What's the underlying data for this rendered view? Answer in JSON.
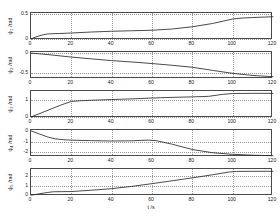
{
  "figure": {
    "title": "",
    "background": "#ffffff",
    "line_color": "#2b2b2b",
    "axis_color": "#4a4a4a",
    "grid_color": "#9a9a9a",
    "xlabel": "t /s"
  },
  "axis": {
    "xticks": [
      "0",
      "20",
      "40",
      "60",
      "80",
      "100",
      "120"
    ],
    "xlim": [
      0,
      120
    ]
  },
  "panels": [
    {
      "ylabel_main": "ψ",
      "ylabel_sub": "1",
      "ylabel_unit": " /rad",
      "yticks": [
        "0",
        "0.5"
      ],
      "ytickvals": [
        0,
        0.5
      ],
      "ylim": [
        -0.02,
        0.52
      ]
    },
    {
      "ylabel_main": "ψ",
      "ylabel_sub": "2",
      "ylabel_unit": " /rad",
      "yticks": [
        "0",
        "-0.5"
      ],
      "ytickvals": [
        0,
        -0.5
      ],
      "ylim": [
        -0.66,
        0.03
      ]
    },
    {
      "ylabel_main": "ψ",
      "ylabel_sub": "3",
      "ylabel_unit": " /rad",
      "yticks": [
        "0",
        "1"
      ],
      "ytickvals": [
        0,
        1
      ],
      "ylim": [
        -0.06,
        1.55
      ]
    },
    {
      "ylabel_main": "ψ",
      "ylabel_sub": "4",
      "ylabel_unit": " /rad",
      "yticks": [
        "0",
        "-1",
        "-2"
      ],
      "ytickvals": [
        0,
        -1,
        -2
      ],
      "ylim": [
        -2.45,
        0.08
      ]
    },
    {
      "ylabel_main": "ψ",
      "ylabel_sub": "5",
      "ylabel_unit": " /rad",
      "yticks": [
        "0",
        "1",
        "2"
      ],
      "ytickvals": [
        0,
        1,
        2
      ],
      "ylim": [
        -0.08,
        2.72
      ]
    }
  ],
  "chart_data": [
    {
      "type": "line",
      "title": "",
      "xlabel": "",
      "ylabel": "ψ1 /rad",
      "xlim": [
        0,
        120
      ],
      "ylim": [
        -0.02,
        0.52
      ],
      "xticks": [
        0,
        20,
        40,
        60,
        80,
        100,
        120
      ],
      "yticks": [
        0,
        0.5
      ],
      "grid": true,
      "legend": "none",
      "x": [
        0,
        2,
        5,
        8,
        10,
        14,
        20,
        30,
        40,
        50,
        60,
        70,
        80,
        90,
        100,
        105,
        110,
        120
      ],
      "y": [
        0.0,
        0.035,
        0.075,
        0.1,
        0.105,
        0.11,
        0.12,
        0.14,
        0.155,
        0.165,
        0.175,
        0.2,
        0.245,
        0.31,
        0.4,
        0.42,
        0.43,
        0.445
      ]
    },
    {
      "type": "line",
      "title": "",
      "xlabel": "",
      "ylabel": "ψ2 /rad",
      "xlim": [
        0,
        120
      ],
      "ylim": [
        -0.66,
        0.03
      ],
      "xticks": [
        0,
        20,
        40,
        60,
        80,
        100,
        120
      ],
      "yticks": [
        0,
        -0.5
      ],
      "grid": true,
      "legend": "none",
      "x": [
        0,
        5,
        10,
        20,
        30,
        40,
        50,
        60,
        70,
        80,
        90,
        100,
        110,
        120
      ],
      "y": [
        0.0,
        -0.02,
        -0.045,
        -0.1,
        -0.145,
        -0.19,
        -0.225,
        -0.265,
        -0.31,
        -0.36,
        -0.44,
        -0.515,
        -0.57,
        -0.6
      ]
    },
    {
      "type": "line",
      "title": "",
      "xlabel": "",
      "ylabel": "ψ3 /rad",
      "xlim": [
        0,
        120
      ],
      "ylim": [
        -0.06,
        1.55
      ],
      "xticks": [
        0,
        20,
        40,
        60,
        80,
        100,
        120
      ],
      "yticks": [
        0,
        1
      ],
      "grid": true,
      "legend": "none",
      "x": [
        0,
        5,
        10,
        15,
        20,
        25,
        30,
        40,
        50,
        60,
        70,
        80,
        88,
        95,
        100,
        110,
        120
      ],
      "y": [
        0.0,
        0.24,
        0.48,
        0.72,
        0.93,
        0.97,
        1.0,
        1.04,
        1.08,
        1.13,
        1.17,
        1.2,
        1.23,
        1.35,
        1.4,
        1.41,
        1.41
      ]
    },
    {
      "type": "line",
      "title": "",
      "xlabel": "",
      "ylabel": "ψ4 /rad",
      "xlim": [
        0,
        120
      ],
      "ylim": [
        -2.45,
        0.08
      ],
      "xticks": [
        0,
        20,
        40,
        60,
        80,
        100,
        120
      ],
      "yticks": [
        0,
        -1,
        -2
      ],
      "grid": true,
      "legend": "none",
      "x": [
        0,
        4,
        8,
        12,
        16,
        20,
        30,
        40,
        50,
        58,
        62,
        70,
        80,
        90,
        100,
        110,
        120
      ],
      "y": [
        0.0,
        -0.28,
        -0.56,
        -0.75,
        -0.83,
        -0.87,
        -0.92,
        -0.95,
        -0.93,
        -0.87,
        -0.92,
        -1.25,
        -1.75,
        -2.05,
        -2.2,
        -2.28,
        -2.33
      ]
    },
    {
      "type": "line",
      "title": "",
      "xlabel": "t /s",
      "ylabel": "ψ5 /rad",
      "xlim": [
        0,
        120
      ],
      "ylim": [
        -0.08,
        2.72
      ],
      "xticks": [
        0,
        20,
        40,
        60,
        80,
        100,
        120
      ],
      "yticks": [
        0,
        1,
        2
      ],
      "grid": true,
      "legend": "none",
      "x": [
        0,
        4,
        8,
        11,
        15,
        20,
        30,
        40,
        50,
        60,
        70,
        80,
        90,
        98,
        102,
        110,
        120
      ],
      "y": [
        0.0,
        0.14,
        0.28,
        0.36,
        0.37,
        0.38,
        0.52,
        0.68,
        0.92,
        1.2,
        1.5,
        1.8,
        2.12,
        2.4,
        2.47,
        2.48,
        2.48
      ]
    }
  ]
}
